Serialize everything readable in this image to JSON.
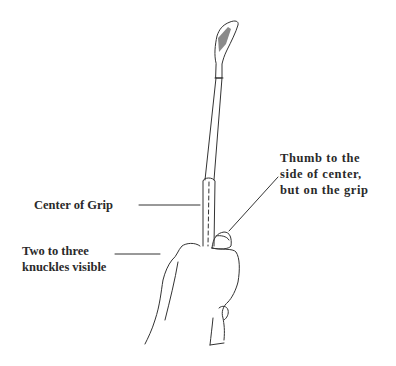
{
  "diagram": {
    "labels": {
      "thumb": [
        "Thumb to the",
        "side of center,",
        "but on the grip"
      ],
      "center": "Center of Grip",
      "knuckles": [
        "Two to three",
        "knuckles visible"
      ]
    },
    "colors": {
      "line": "#333333",
      "clubface_shade": "#8a8a8a",
      "text": "#2a2a2a",
      "background": "#ffffff"
    }
  }
}
